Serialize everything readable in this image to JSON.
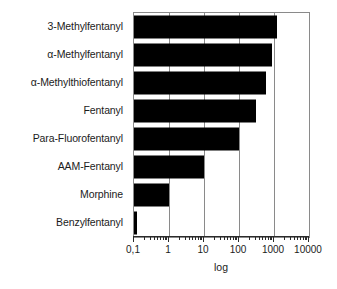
{
  "chart_data": {
    "type": "bar",
    "orientation": "horizontal",
    "title": "",
    "xlabel": "log",
    "ylabel": "",
    "xscale": "log",
    "xlim": [
      0.1,
      10000
    ],
    "grid": true,
    "legend": false,
    "categories": [
      "3-Methylfentanyl",
      "α-Methylfentanyl",
      "α-Methylthiofentanyl",
      "Fentanyl",
      "Para-Fluorofentanyl",
      "AAM-Fentanyl",
      "Morphine",
      "Benzylfentanyl"
    ],
    "values": [
      1200,
      900,
      600,
      300,
      100,
      10,
      1,
      0.12
    ],
    "xticks": [
      0.1,
      1,
      10,
      100,
      1000,
      10000
    ],
    "xtick_labels": [
      "0,1",
      "1",
      "10",
      "100",
      "1000",
      "10000"
    ],
    "bar_color": "#000000",
    "frame_color": "#8a8a8a",
    "background": "#ffffff"
  }
}
